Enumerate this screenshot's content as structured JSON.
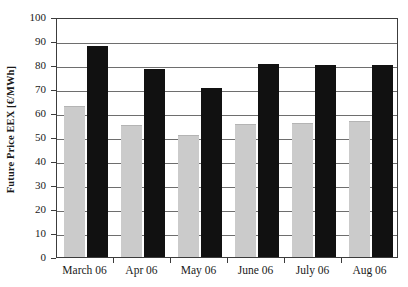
{
  "chart_data": {
    "type": "bar",
    "title": "",
    "xlabel": "",
    "ylabel": "Future Price EEX [€/MWh]",
    "ylim": [
      0,
      100
    ],
    "yticks": [
      0,
      10,
      20,
      30,
      40,
      50,
      60,
      70,
      80,
      90,
      100
    ],
    "ytick_labels": [
      "0",
      "10",
      "20",
      "30",
      "40",
      "50",
      "60",
      "70",
      "80",
      "90",
      "100"
    ],
    "grid": true,
    "legend": "none",
    "categories": [
      "March 06",
      "Apr 06",
      "May 06",
      "June 06",
      "July 06",
      "Aug 06"
    ],
    "series": [
      {
        "name": "Series 1",
        "color": "#cbcbcb",
        "values": [
          63,
          55,
          51,
          55.5,
          56,
          56.5
        ]
      },
      {
        "name": "Series 2",
        "color": "#111111",
        "values": [
          88,
          78.5,
          70.5,
          80.5,
          80,
          80
        ]
      }
    ]
  }
}
